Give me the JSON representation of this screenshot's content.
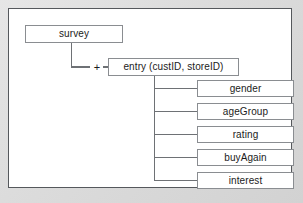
{
  "diagram": {
    "type": "hierarchical-schema-tree",
    "root": {
      "label": "survey"
    },
    "child_entity": {
      "label": "entry (custID, storeID)",
      "multiplicity_symbol": "+"
    },
    "attributes": [
      {
        "label": "gender"
      },
      {
        "label": "ageGroup"
      },
      {
        "label": "rating"
      },
      {
        "label": "buyAgain"
      },
      {
        "label": "interest"
      }
    ]
  },
  "style": {
    "panel_background": "#ffffff",
    "panel_border": "#55585c",
    "page_background": "#dcdcdc",
    "box_border": "#8a8d91",
    "connector_color": "#6e7175",
    "text_color": "#1b1b1b"
  }
}
